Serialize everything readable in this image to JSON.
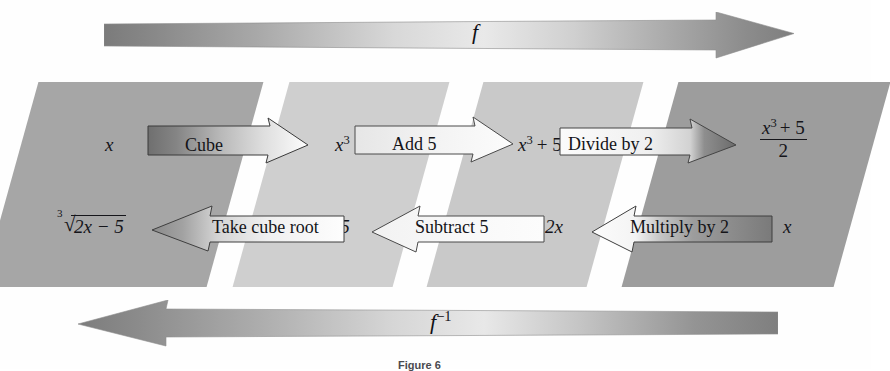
{
  "figure": {
    "caption": "Figure 6",
    "forward_label": "f",
    "inverse_label": "f",
    "inverse_exponent": "−1"
  },
  "stages": [
    {
      "name": "stage-1",
      "shade": "#a6a6a6",
      "top_value_plain": "x",
      "top_value": {
        "base": "x",
        "exponent": ""
      },
      "bottom_value_plain": "∛(2x − 5)",
      "bottom_radical_index": "3",
      "bottom_radicand": "2x − 5"
    },
    {
      "name": "stage-2",
      "shade": "#cfcfcf",
      "top_value_plain": "x³",
      "top_value": {
        "base": "x",
        "exponent": "3"
      },
      "bottom_value_plain": "2x − 5"
    },
    {
      "name": "stage-3",
      "shade": "#c9c9c9",
      "top_value_plain": "x³ + 5",
      "top_value": {
        "base": "x",
        "exponent": "3",
        "rest": "+ 5"
      },
      "bottom_value_plain": "2x"
    },
    {
      "name": "stage-4",
      "shade": "#9d9d9d",
      "top_value_plain": "(x³ + 5)/2",
      "top_fraction": {
        "numerator_base": "x",
        "numerator_exponent": "3",
        "numerator_rest": "+ 5",
        "denominator": "2"
      },
      "bottom_value_plain": "x"
    }
  ],
  "forward_operations": [
    {
      "name": "op-cube",
      "label": "Cube",
      "direction": "right",
      "gradient_from": "#6f6f6f",
      "gradient_to": "#ffffff"
    },
    {
      "name": "op-add-5",
      "label": "Add 5",
      "direction": "right",
      "gradient_from": "#e8e8e8",
      "gradient_to": "#fdfdfd"
    },
    {
      "name": "op-divide-by-2",
      "label": "Divide by 2",
      "direction": "right",
      "gradient_from": "#fbfbfb",
      "gradient_to": "#6b6b6b"
    }
  ],
  "inverse_operations": [
    {
      "name": "op-multiply-by-2",
      "label": "Multiply by 2",
      "direction": "left",
      "gradient_from": "#fcfcfc",
      "gradient_to": "#7a7a7a"
    },
    {
      "name": "op-subtract-5",
      "label": "Subtract 5",
      "direction": "left",
      "gradient_from": "#f2f2f2",
      "gradient_to": "#fbfbfb"
    },
    {
      "name": "op-take-cube-root",
      "label": "Take cube root",
      "direction": "left",
      "gradient_from": "#8a8a8a",
      "gradient_to": "#fdfdfd"
    }
  ],
  "colors": {
    "background": "#ffffff",
    "ink": "#15151a",
    "band_dark": "#787878",
    "band_light": "#e6e6e6",
    "caption_color": "#4a4a4e"
  }
}
